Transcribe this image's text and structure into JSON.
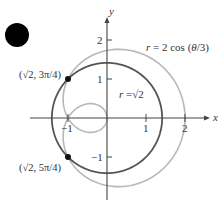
{
  "bullet": {
    "cx": 17,
    "cy": 35,
    "r": 12,
    "color": "#000000"
  },
  "axes": {
    "origin_px": [
      107,
      118
    ],
    "unit_px": 39,
    "x_range_px": [
      30,
      210
    ],
    "y_range_px": [
      200,
      17
    ],
    "x_label": "x",
    "y_label": "y",
    "x_ticks": [
      {
        "v": -1,
        "label": "−1"
      },
      {
        "v": 1,
        "label": "1"
      },
      {
        "v": 2,
        "label": "2"
      }
    ],
    "y_ticks": [
      {
        "v": 2,
        "label": "2"
      },
      {
        "v": 1,
        "label": "1"
      },
      {
        "v": -1,
        "label": "−1"
      }
    ],
    "color": "#444444"
  },
  "chart_data": {
    "type": "line",
    "title": "",
    "xlabel": "x",
    "ylabel": "y",
    "xlim": [
      -2,
      2.5
    ],
    "ylim": [
      -2,
      2.5
    ],
    "grid": false,
    "series": [
      {
        "name": "r = √2",
        "kind": "polar",
        "equation": "r = sqrt(2)",
        "theta_range": [
          0,
          6.2832
        ],
        "color": "#555555"
      },
      {
        "name": "r = 2 cos (θ/3)",
        "kind": "polar",
        "equation": "r = 2*cos(theta/3)",
        "theta_range": [
          0,
          18.8496
        ],
        "color": "#b8b8b8"
      }
    ],
    "points": [
      {
        "label": "(√2, 3π/4)",
        "x": -1,
        "y": 1
      },
      {
        "label": "(√2, 5π/4)",
        "x": -1,
        "y": -1
      }
    ],
    "annotations": [
      {
        "text": "r = 2 cos (θ/3)",
        "x_px": 146,
        "y_px": 51
      },
      {
        "text": "r =√2",
        "x_px": 119,
        "y_px": 97
      }
    ]
  },
  "labels": {
    "curve_outer": "r = 2 cos (θ/3)",
    "curve_inner": "r =√2",
    "point_top": "(√2, 3π/4)",
    "point_bottom": "(√2, 5π/4)"
  }
}
